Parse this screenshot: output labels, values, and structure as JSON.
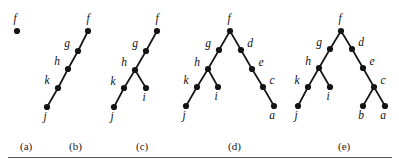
{
  "figure": {
    "width": 399,
    "height": 167,
    "background_color": "#ffffff",
    "node_color": "#141414",
    "edge_color": "#141414",
    "rule_color": "#555555"
  },
  "captions": [
    {
      "label": "(a)",
      "x": 20,
      "y": 140
    },
    {
      "label": "(b)",
      "x": 69,
      "y": 140
    },
    {
      "label": "(c)",
      "x": 136,
      "y": 140
    },
    {
      "label": "(d)",
      "x": 228,
      "y": 140
    },
    {
      "label": "(e)",
      "x": 338,
      "y": 140
    }
  ],
  "panels": [
    {
      "id": "a",
      "caption": "(a)",
      "nodes": [
        {
          "id": "f",
          "label": "f",
          "x": 17,
          "y": 31,
          "label_dx": -2,
          "label_dy": -9
        }
      ],
      "edges": []
    },
    {
      "id": "b",
      "caption": "(b)",
      "nodes": [
        {
          "id": "f",
          "label": "f",
          "x": 88,
          "y": 31,
          "label_dx": 0,
          "label_dy": -9
        },
        {
          "id": "g",
          "label": "g",
          "x": 78,
          "y": 51,
          "label_dx": -11,
          "label_dy": -4
        },
        {
          "id": "h",
          "label": "h",
          "x": 68,
          "y": 69,
          "label_dx": -11,
          "label_dy": -4
        },
        {
          "id": "k",
          "label": "k",
          "x": 58,
          "y": 88,
          "label_dx": -11,
          "label_dy": -4
        },
        {
          "id": "j",
          "label": "j",
          "x": 47,
          "y": 107,
          "label_dx": -2,
          "label_dy": 13
        }
      ],
      "edges": [
        {
          "from": "f",
          "to": "g"
        },
        {
          "from": "g",
          "to": "h"
        },
        {
          "from": "h",
          "to": "k"
        },
        {
          "from": "k",
          "to": "j"
        }
      ]
    },
    {
      "id": "c",
      "caption": "(c)",
      "nodes": [
        {
          "id": "f",
          "label": "f",
          "x": 157,
          "y": 31,
          "label_dx": 0,
          "label_dy": -9
        },
        {
          "id": "g",
          "label": "g",
          "x": 146,
          "y": 51,
          "label_dx": -11,
          "label_dy": -4
        },
        {
          "id": "h",
          "label": "h",
          "x": 135,
          "y": 70,
          "label_dx": -11,
          "label_dy": -4
        },
        {
          "id": "k",
          "label": "k",
          "x": 124,
          "y": 88,
          "label_dx": -11,
          "label_dy": -3
        },
        {
          "id": "i",
          "label": "i",
          "x": 146,
          "y": 88,
          "label_dx": -2,
          "label_dy": 13
        },
        {
          "id": "j",
          "label": "j",
          "x": 114,
          "y": 107,
          "label_dx": -2,
          "label_dy": 13
        }
      ],
      "edges": [
        {
          "from": "f",
          "to": "g"
        },
        {
          "from": "g",
          "to": "h"
        },
        {
          "from": "h",
          "to": "k"
        },
        {
          "from": "h",
          "to": "i"
        },
        {
          "from": "k",
          "to": "j"
        }
      ]
    },
    {
      "id": "d",
      "caption": "(d)",
      "nodes": [
        {
          "id": "f",
          "label": "f",
          "x": 230,
          "y": 31,
          "label_dx": -1,
          "label_dy": -9
        },
        {
          "id": "g",
          "label": "g",
          "x": 219,
          "y": 50,
          "label_dx": -11,
          "label_dy": -3
        },
        {
          "id": "d",
          "label": "d",
          "x": 241,
          "y": 50,
          "label_dx": 9,
          "label_dy": -3
        },
        {
          "id": "h",
          "label": "h",
          "x": 208,
          "y": 69,
          "label_dx": -11,
          "label_dy": -3
        },
        {
          "id": "e",
          "label": "e",
          "x": 252,
          "y": 69,
          "label_dx": 9,
          "label_dy": -3
        },
        {
          "id": "k",
          "label": "k",
          "x": 197,
          "y": 87,
          "label_dx": -11,
          "label_dy": -3
        },
        {
          "id": "i",
          "label": "i",
          "x": 218,
          "y": 87,
          "label_dx": -2,
          "label_dy": 13
        },
        {
          "id": "c",
          "label": "c",
          "x": 263,
          "y": 87,
          "label_dx": 9,
          "label_dy": -3
        },
        {
          "id": "j",
          "label": "j",
          "x": 186,
          "y": 106,
          "label_dx": -2,
          "label_dy": 13
        },
        {
          "id": "a",
          "label": "a",
          "x": 274,
          "y": 106,
          "label_dx": -2,
          "label_dy": 13
        }
      ],
      "edges": [
        {
          "from": "f",
          "to": "g"
        },
        {
          "from": "f",
          "to": "d"
        },
        {
          "from": "g",
          "to": "h"
        },
        {
          "from": "d",
          "to": "e"
        },
        {
          "from": "h",
          "to": "k"
        },
        {
          "from": "h",
          "to": "i"
        },
        {
          "from": "e",
          "to": "c"
        },
        {
          "from": "k",
          "to": "j"
        },
        {
          "from": "c",
          "to": "a"
        }
      ]
    },
    {
      "id": "e",
      "caption": "(e)",
      "nodes": [
        {
          "id": "f",
          "label": "f",
          "x": 341,
          "y": 31,
          "label_dx": -1,
          "label_dy": -9
        },
        {
          "id": "g",
          "label": "g",
          "x": 330,
          "y": 49,
          "label_dx": -11,
          "label_dy": -3
        },
        {
          "id": "d",
          "label": "d",
          "x": 352,
          "y": 49,
          "label_dx": 9,
          "label_dy": -3
        },
        {
          "id": "h",
          "label": "h",
          "x": 319,
          "y": 68,
          "label_dx": -11,
          "label_dy": -3
        },
        {
          "id": "e",
          "label": "e",
          "x": 363,
          "y": 68,
          "label_dx": 9,
          "label_dy": -3
        },
        {
          "id": "k",
          "label": "k",
          "x": 308,
          "y": 87,
          "label_dx": -11,
          "label_dy": -3
        },
        {
          "id": "i",
          "label": "i",
          "x": 330,
          "y": 87,
          "label_dx": -2,
          "label_dy": 13
        },
        {
          "id": "c",
          "label": "c",
          "x": 374,
          "y": 87,
          "label_dx": 9,
          "label_dy": -3
        },
        {
          "id": "j",
          "label": "j",
          "x": 298,
          "y": 106,
          "label_dx": -2,
          "label_dy": 13
        },
        {
          "id": "b",
          "label": "b",
          "x": 363,
          "y": 106,
          "label_dx": -2,
          "label_dy": 13
        },
        {
          "id": "a",
          "label": "a",
          "x": 385,
          "y": 106,
          "label_dx": -2,
          "label_dy": 13
        }
      ],
      "edges": [
        {
          "from": "f",
          "to": "g"
        },
        {
          "from": "f",
          "to": "d"
        },
        {
          "from": "g",
          "to": "h"
        },
        {
          "from": "d",
          "to": "e"
        },
        {
          "from": "h",
          "to": "k"
        },
        {
          "from": "h",
          "to": "i"
        },
        {
          "from": "e",
          "to": "c"
        },
        {
          "from": "k",
          "to": "j"
        },
        {
          "from": "c",
          "to": "b"
        },
        {
          "from": "c",
          "to": "a"
        }
      ]
    }
  ]
}
